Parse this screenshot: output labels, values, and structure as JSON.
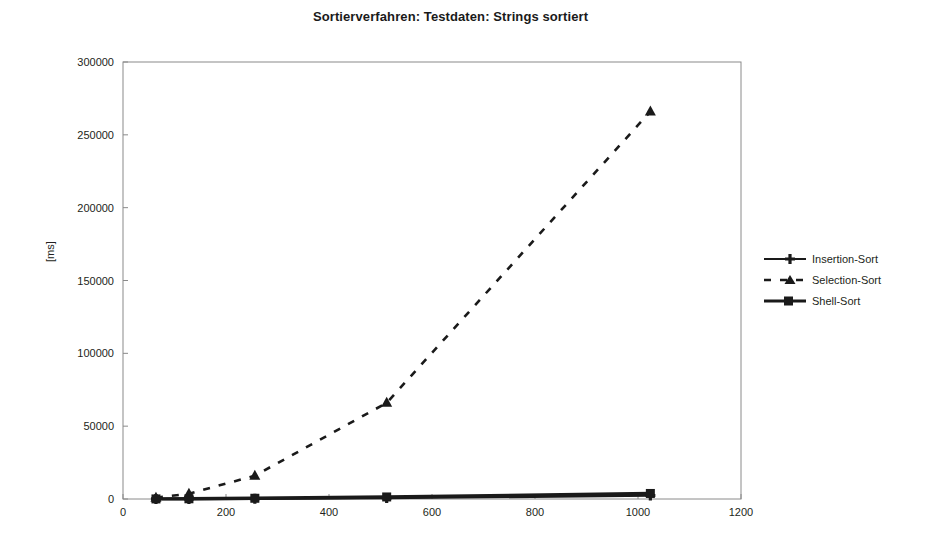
{
  "chart_data": {
    "type": "line",
    "title": "Sortierverfahren: Testdaten: Strings sortiert",
    "xlabel": "",
    "ylabel": "[ms]",
    "xlim": [
      0,
      1200
    ],
    "ylim": [
      0,
      300000
    ],
    "xticks": [
      0,
      200,
      400,
      600,
      800,
      1000,
      1200
    ],
    "yticks": [
      0,
      50000,
      100000,
      150000,
      200000,
      250000,
      300000
    ],
    "xtick_labels": [
      "0",
      "200",
      "400",
      "600",
      "800",
      "1000",
      "1200"
    ],
    "ytick_labels": [
      "0",
      "50000",
      "100000",
      "150000",
      "200000",
      "250000",
      "300000"
    ],
    "grid": false,
    "legend_position": "right",
    "x": [
      64,
      128,
      256,
      512,
      1024
    ],
    "series": [
      {
        "name": "Insertion-Sort",
        "values": [
          20,
          60,
          200,
          700,
          2400
        ],
        "style": "solid",
        "marker": "plus",
        "color": "#1a1a1a"
      },
      {
        "name": "Selection-Sort",
        "values": [
          900,
          3600,
          16000,
          66000,
          266000
        ],
        "style": "dashed",
        "marker": "triangle",
        "color": "#1a1a1a"
      },
      {
        "name": "Shell-Sort",
        "values": [
          60,
          150,
          500,
          1400,
          3800
        ],
        "style": "solid",
        "marker": "square",
        "color": "#1a1a1a"
      }
    ]
  },
  "legend": {
    "items": [
      {
        "label": "Insertion-Sort",
        "marker": "plus-marker",
        "style": "solid"
      },
      {
        "label": "Selection-Sort",
        "marker": "triangle-marker",
        "style": "dashed"
      },
      {
        "label": "Shell-Sort",
        "marker": "square-marker",
        "style": "solid"
      }
    ]
  },
  "colors": {
    "ink": "#1a1a1a",
    "axis": "#8a8a8a",
    "background": "#ffffff"
  }
}
